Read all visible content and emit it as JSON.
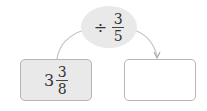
{
  "operator": {
    "symbol": "÷",
    "fraction": {
      "numerator": "3",
      "denominator": "5"
    }
  },
  "input_box": {
    "whole": "3",
    "fraction": {
      "numerator": "3",
      "denominator": "8"
    }
  },
  "output_box": {
    "value": ""
  },
  "colors": {
    "fill": "#e9e9e9",
    "border": "#b5b5b5",
    "arrow": "#bbbbbb"
  }
}
